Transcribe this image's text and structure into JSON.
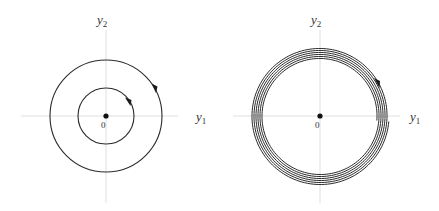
{
  "figure": {
    "panels": [
      {
        "id": "left",
        "description": "Center with closed periodic orbits (concentric circles)",
        "x_axis_label": "y",
        "x_axis_subscript": "1",
        "y_axis_label": "y",
        "y_axis_subscript": "2",
        "origin_label": "0",
        "center": [
          106,
          116
        ],
        "orbits": [
          {
            "radius": 28,
            "arrow_direction": "clockwise"
          },
          {
            "radius": 56,
            "arrow_direction": "clockwise"
          }
        ]
      },
      {
        "id": "right",
        "description": "Slowly spiraling trajectory (tightly wound spiral)",
        "x_axis_label": "y",
        "x_axis_subscript": "1",
        "y_axis_label": "y",
        "y_axis_subscript": "2",
        "origin_label": "0",
        "center": [
          320,
          116
        ],
        "spiral": {
          "outer_radius": 69,
          "inner_radius": 57,
          "turns": 6,
          "arrow_direction": "clockwise"
        }
      }
    ],
    "colors": {
      "curve": "#2a2a2a",
      "axis": "#d8d8d8",
      "text": "#333333"
    }
  }
}
